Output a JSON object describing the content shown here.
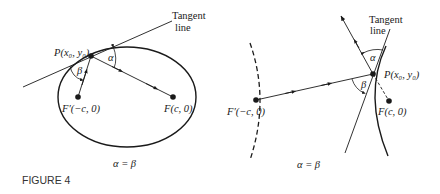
{
  "figure": {
    "caption": "FIGURE 4",
    "colors": {
      "ink": "#1a1a1a",
      "caption": "#333333",
      "background": "#ffffff"
    }
  },
  "left_panel": {
    "title": "Ellipse reflection property",
    "tangent_label_line1": "Tangent",
    "tangent_label_line2": "line",
    "point_label": "P(x₀, y₀)",
    "left_focus_label": "F′(−c, 0)",
    "right_focus_label": "F(c, 0)",
    "angle_alpha": "α",
    "angle_beta": "β",
    "equation": "α = β"
  },
  "right_panel": {
    "title": "Hyperbola reflection property",
    "tangent_label_line1": "Tangent",
    "tangent_label_line2": "line",
    "point_label": "P(x₀, y₀)",
    "left_focus_label": "F′(−c, 0)",
    "right_focus_label": "F(c, 0)",
    "angle_alpha": "α",
    "angle_beta": "β",
    "equation": "α = β"
  }
}
